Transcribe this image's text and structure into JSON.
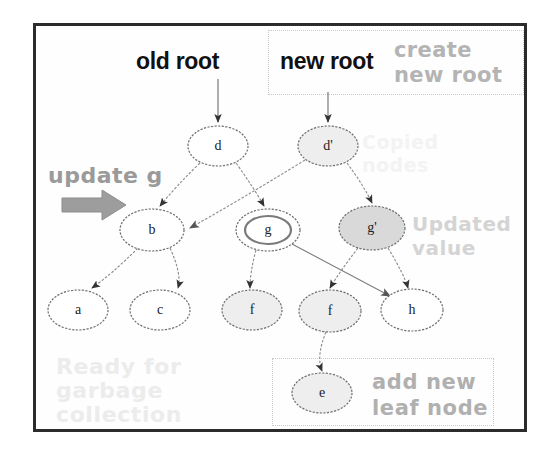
{
  "figure": {
    "title_labels": {
      "old_root": "old root",
      "new_root": "new root"
    },
    "annotations": {
      "create_new_root": "create\nnew root",
      "copied_nodes": "Copied\nnodes",
      "updated_value": "Updated\nvalue",
      "ready_for_gc": "Ready for\ngarbage\ncollection",
      "update_g": "update g",
      "add_new_leaf_node": "add new\nleaf node"
    },
    "colors": {
      "frame_border": "#2b2b2b",
      "background": "#ffffff",
      "node_outline": "#6e6e6e",
      "node_fill_white": "#ffffff",
      "node_fill_gray": "#d9d9d9",
      "node_fill_lightgray": "#eeeeee",
      "edge": "#8a8a8a",
      "arrowhead": "#333333",
      "annotation_box_border": "#c9c9c9",
      "text_dark": "#111111",
      "text_gray": "#9a9a9a",
      "text_faint": "#ececec",
      "block_arrow": "#9d9d9d"
    },
    "nodes": [
      {
        "id": "d",
        "label": "d",
        "x": 218,
        "y": 146,
        "rx": 30,
        "ry": 20,
        "fill": "white",
        "double": false
      },
      {
        "id": "dp",
        "label": "d'",
        "x": 328,
        "y": 146,
        "rx": 30,
        "ry": 20,
        "fill": "lightgray",
        "double": false
      },
      {
        "id": "b",
        "label": "b",
        "x": 152,
        "y": 230,
        "rx": 32,
        "ry": 21,
        "fill": "white",
        "double": false
      },
      {
        "id": "g",
        "label": "g",
        "x": 268,
        "y": 230,
        "rx": 32,
        "ry": 21,
        "fill": "white",
        "double": true
      },
      {
        "id": "gp",
        "label": "g'",
        "x": 372,
        "y": 228,
        "rx": 33,
        "ry": 22,
        "fill": "gray",
        "double": false
      },
      {
        "id": "a",
        "label": "a",
        "x": 78,
        "y": 310,
        "rx": 30,
        "ry": 20,
        "fill": "white",
        "double": false
      },
      {
        "id": "c",
        "label": "c",
        "x": 160,
        "y": 310,
        "rx": 30,
        "ry": 20,
        "fill": "white",
        "double": false
      },
      {
        "id": "f",
        "label": "f",
        "x": 252,
        "y": 310,
        "rx": 30,
        "ry": 20,
        "fill": "lightgray",
        "double": false
      },
      {
        "id": "f2",
        "label": "f",
        "x": 330,
        "y": 311,
        "rx": 31,
        "ry": 21,
        "fill": "lightgray",
        "double": false
      },
      {
        "id": "h",
        "label": "h",
        "x": 412,
        "y": 310,
        "rx": 31,
        "ry": 21,
        "fill": "white",
        "double": false
      },
      {
        "id": "e",
        "label": "e",
        "x": 322,
        "y": 393,
        "rx": 30,
        "ry": 20,
        "fill": "lightgray",
        "double": false
      }
    ],
    "edges": [
      {
        "from": "root-old",
        "to": "d",
        "note": "old root pointer"
      },
      {
        "from": "root-new",
        "to": "dp",
        "note": "new root pointer"
      },
      {
        "from": "d",
        "to": "b"
      },
      {
        "from": "d",
        "to": "g"
      },
      {
        "from": "dp",
        "to": "b"
      },
      {
        "from": "dp",
        "to": "gp"
      },
      {
        "from": "b",
        "to": "a"
      },
      {
        "from": "b",
        "to": "c"
      },
      {
        "from": "g",
        "to": "f"
      },
      {
        "from": "g",
        "to": "h"
      },
      {
        "from": "gp",
        "to": "f2"
      },
      {
        "from": "gp",
        "to": "h"
      },
      {
        "from": "f2",
        "to": "e"
      }
    ]
  }
}
